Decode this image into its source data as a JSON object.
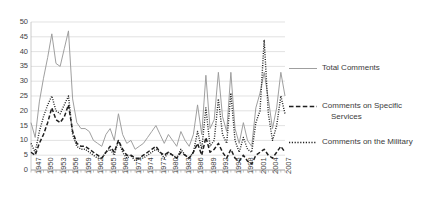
{
  "chart_data": {
    "type": "line",
    "title": "",
    "xlabel": "",
    "ylabel": "",
    "ylim": [
      0,
      50
    ],
    "ytick_step": 5,
    "yticks": [
      0,
      5,
      10,
      15,
      20,
      25,
      30,
      35,
      40,
      45,
      50
    ],
    "grid": true,
    "grid_axis": "y",
    "legend_position": "right",
    "xtick_labels": [
      "1947",
      "1950",
      "1953",
      "1956",
      "1959",
      "1962",
      "1965",
      "1968",
      "1971",
      "1974",
      "1977",
      "1980",
      "1983",
      "1986",
      "1989",
      "1992",
      "1995",
      "1998",
      "2001",
      "2004",
      "2007"
    ],
    "xtick_step": 3,
    "x": [
      1947,
      1948,
      1949,
      1950,
      1951,
      1952,
      1953,
      1954,
      1955,
      1956,
      1957,
      1958,
      1959,
      1960,
      1961,
      1962,
      1963,
      1964,
      1965,
      1966,
      1967,
      1968,
      1969,
      1970,
      1971,
      1972,
      1973,
      1974,
      1975,
      1976,
      1977,
      1978,
      1979,
      1980,
      1981,
      1982,
      1983,
      1984,
      1985,
      1986,
      1987,
      1988,
      1989,
      1990,
      1991,
      1992,
      1993,
      1994,
      1995,
      1996,
      1997,
      1998,
      1999,
      2000,
      2001,
      2002,
      2003,
      2004,
      2005,
      2006,
      2007,
      2008
    ],
    "series": [
      {
        "name": "Total Comments",
        "style": "solid",
        "color": "#9a9a9a",
        "values": [
          16,
          11,
          23,
          31,
          38,
          46,
          36,
          35,
          41,
          47,
          24,
          16,
          14,
          14,
          13,
          10,
          9,
          8,
          12,
          14,
          10,
          19,
          12,
          9,
          10,
          7,
          8,
          9,
          11,
          13,
          15,
          12,
          9,
          12,
          10,
          8,
          13,
          10,
          8,
          12,
          22,
          12,
          32,
          14,
          17,
          33,
          18,
          13,
          33,
          14,
          9,
          16,
          10,
          8,
          21,
          26,
          33,
          24,
          14,
          21,
          33,
          25
        ]
      },
      {
        "name": "Comments on Specific Services",
        "style": "dashed",
        "color": "#1f1f1f",
        "values": [
          6,
          5,
          9,
          12,
          16,
          21,
          17,
          16,
          18,
          22,
          13,
          9,
          8,
          8,
          7,
          6,
          5,
          4,
          6,
          8,
          6,
          10,
          7,
          5,
          5,
          4,
          4,
          5,
          6,
          7,
          8,
          6,
          5,
          6,
          5,
          4,
          6,
          5,
          4,
          6,
          9,
          5,
          11,
          6,
          7,
          9,
          6,
          4,
          7,
          4,
          3,
          5,
          3,
          2,
          5,
          6,
          7,
          5,
          4,
          6,
          8,
          6
        ]
      },
      {
        "name": "Comments on the Military",
        "style": "dotted",
        "color": "#1f1f1f",
        "values": [
          9,
          6,
          13,
          18,
          22,
          25,
          20,
          19,
          22,
          25,
          12,
          8,
          7,
          7,
          6,
          5,
          4,
          4,
          6,
          7,
          5,
          10,
          6,
          4,
          5,
          3,
          4,
          4,
          5,
          6,
          7,
          6,
          4,
          6,
          5,
          4,
          7,
          5,
          4,
          6,
          13,
          7,
          21,
          8,
          10,
          24,
          12,
          9,
          26,
          10,
          6,
          11,
          7,
          6,
          16,
          20,
          44,
          19,
          10,
          15,
          25,
          19
        ]
      }
    ]
  },
  "legend": {
    "entries": [
      {
        "label": "Total Comments",
        "label_line2": ""
      },
      {
        "label": "Comments on Specific",
        "label_line2": "Services"
      },
      {
        "label": "Comments on the Military",
        "label_line2": ""
      }
    ]
  }
}
